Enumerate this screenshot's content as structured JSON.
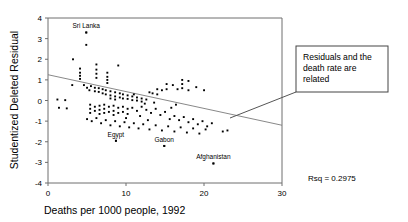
{
  "chart_data": {
    "type": "scatter",
    "title": "",
    "xlabel": "Deaths per 1000 people, 1992",
    "ylabel": "Studentized Deleted Residual",
    "xlim": [
      0,
      30
    ],
    "ylim": [
      -4,
      4
    ],
    "xticks": [
      0,
      10,
      20,
      30
    ],
    "yticks": [
      4,
      3,
      2,
      1,
      0,
      -1,
      -2,
      -3,
      -4
    ],
    "grid": false,
    "legend": "none",
    "fit_line": {
      "type": "linear-regression",
      "x_start": 0,
      "y_start": 1.25,
      "x_end": 30,
      "y_end": -1.2
    },
    "annotations": [
      {
        "name": "rsq",
        "text": "Rsq = 0.2975",
        "x_px": 308,
        "y_px": 181
      }
    ],
    "callout": {
      "lines": [
        "Residuals and the",
        "death rate are",
        "related"
      ],
      "box_x_px": 296,
      "box_y_px": 46,
      "box_w_px": 92,
      "box_h_px": 46,
      "leader_from_px": [
        296,
        92
      ],
      "leader_to_px": [
        230,
        118
      ]
    },
    "point_labels": [
      {
        "name": "sri-lanka",
        "text": "Sri Lanka",
        "x": 4.9,
        "y": 3.3
      },
      {
        "name": "egypt",
        "text": "Egypt",
        "x": 8.7,
        "y": -1.95
      },
      {
        "name": "gabon",
        "text": "Gabon",
        "x": 14.9,
        "y": -2.2
      },
      {
        "name": "afghanistan",
        "text": "Afghanistan",
        "x": 21.2,
        "y": -3.05
      }
    ],
    "points": [
      [
        4.9,
        3.3
      ],
      [
        4.9,
        2.7
      ],
      [
        3.2,
        2.0
      ],
      [
        6.2,
        1.75
      ],
      [
        4.1,
        1.55
      ],
      [
        4.1,
        1.35
      ],
      [
        4.1,
        1.2
      ],
      [
        4.1,
        1.05
      ],
      [
        6.2,
        1.5
      ],
      [
        6.2,
        1.3
      ],
      [
        6.2,
        1.1
      ],
      [
        7.6,
        1.35
      ],
      [
        7.6,
        1.15
      ],
      [
        7.6,
        1.0
      ],
      [
        7.6,
        0.85
      ],
      [
        9.0,
        1.7
      ],
      [
        3.1,
        0.75
      ],
      [
        4.6,
        0.75
      ],
      [
        5.0,
        0.62
      ],
      [
        5.5,
        0.7
      ],
      [
        5.3,
        0.5
      ],
      [
        6.0,
        0.62
      ],
      [
        6.0,
        0.45
      ],
      [
        6.5,
        0.6
      ],
      [
        6.5,
        0.42
      ],
      [
        7.0,
        0.55
      ],
      [
        7.0,
        0.35
      ],
      [
        7.4,
        0.5
      ],
      [
        7.4,
        0.3
      ],
      [
        8.0,
        0.45
      ],
      [
        8.0,
        0.25
      ],
      [
        8.0,
        0.1
      ],
      [
        8.6,
        0.4
      ],
      [
        8.6,
        0.2
      ],
      [
        8.6,
        0.05
      ],
      [
        9.2,
        0.35
      ],
      [
        9.2,
        0.15
      ],
      [
        9.6,
        0.3
      ],
      [
        9.6,
        0.1
      ],
      [
        10.2,
        0.25
      ],
      [
        10.2,
        0.08
      ],
      [
        10.8,
        0.2
      ],
      [
        10.8,
        0.02
      ],
      [
        11.4,
        0.15
      ],
      [
        11.4,
        0.0
      ],
      [
        12.0,
        0.1
      ],
      [
        12.0,
        -0.05
      ],
      [
        12.6,
        0.05
      ],
      [
        13.0,
        0.4
      ],
      [
        13.4,
        0.35
      ],
      [
        14.0,
        0.55
      ],
      [
        14.0,
        0.3
      ],
      [
        14.6,
        0.5
      ],
      [
        15.2,
        0.8
      ],
      [
        15.2,
        0.55
      ],
      [
        16.0,
        0.75
      ],
      [
        16.6,
        0.55
      ],
      [
        17.2,
        1.0
      ],
      [
        17.2,
        0.8
      ],
      [
        17.2,
        0.6
      ],
      [
        18.0,
        0.95
      ],
      [
        18.0,
        0.5
      ],
      [
        19.0,
        0.65
      ],
      [
        20.0,
        0.5
      ],
      [
        1.2,
        0.05
      ],
      [
        2.2,
        0.02
      ],
      [
        1.4,
        -0.35
      ],
      [
        2.4,
        -0.38
      ],
      [
        5.4,
        -0.2
      ],
      [
        5.4,
        -0.4
      ],
      [
        5.4,
        -0.6
      ],
      [
        6.0,
        -0.3
      ],
      [
        6.0,
        -0.5
      ],
      [
        6.6,
        -0.25
      ],
      [
        6.6,
        -0.45
      ],
      [
        6.6,
        -0.65
      ],
      [
        7.2,
        -0.2
      ],
      [
        7.2,
        -0.4
      ],
      [
        7.2,
        -0.6
      ],
      [
        7.8,
        -0.3
      ],
      [
        7.8,
        -0.55
      ],
      [
        8.4,
        -0.25
      ],
      [
        8.4,
        -0.5
      ],
      [
        8.4,
        -0.7
      ],
      [
        9.0,
        -0.35
      ],
      [
        9.0,
        -0.6
      ],
      [
        9.6,
        -0.3
      ],
      [
        9.6,
        -0.55
      ],
      [
        10.2,
        -0.4
      ],
      [
        10.2,
        -0.65
      ],
      [
        10.8,
        -0.35
      ],
      [
        11.4,
        -0.5
      ],
      [
        12.0,
        -0.3
      ],
      [
        12.6,
        -0.45
      ],
      [
        13.2,
        -0.6
      ],
      [
        13.8,
        -0.4
      ],
      [
        14.4,
        -0.7
      ],
      [
        15.0,
        -0.55
      ],
      [
        15.6,
        -0.9
      ],
      [
        16.2,
        -0.75
      ],
      [
        16.8,
        -0.95
      ],
      [
        17.4,
        -0.8
      ],
      [
        18.0,
        -1.05
      ],
      [
        18.6,
        -0.9
      ],
      [
        19.2,
        -1.15
      ],
      [
        19.8,
        -1.0
      ],
      [
        20.4,
        -1.25
      ],
      [
        21.0,
        -1.1
      ],
      [
        5.0,
        -0.9
      ],
      [
        5.6,
        -1.0
      ],
      [
        6.2,
        -0.85
      ],
      [
        6.8,
        -1.1
      ],
      [
        7.4,
        -0.95
      ],
      [
        8.0,
        -1.2
      ],
      [
        8.6,
        -1.0
      ],
      [
        9.2,
        -1.25
      ],
      [
        9.8,
        -1.05
      ],
      [
        10.4,
        -1.3
      ],
      [
        11.0,
        -1.1
      ],
      [
        11.6,
        -1.35
      ],
      [
        12.2,
        -1.15
      ],
      [
        13.0,
        -1.4
      ],
      [
        13.8,
        -1.2
      ],
      [
        14.6,
        -1.45
      ],
      [
        15.4,
        -1.25
      ],
      [
        16.2,
        -1.5
      ],
      [
        17.0,
        -1.3
      ],
      [
        17.8,
        -1.55
      ],
      [
        18.6,
        -1.35
      ],
      [
        19.4,
        -1.6
      ],
      [
        20.2,
        -1.4
      ],
      [
        8.7,
        -1.95
      ],
      [
        14.9,
        -2.2
      ],
      [
        21.2,
        -3.05
      ],
      [
        22.4,
        -1.5
      ],
      [
        23.0,
        -1.45
      ],
      [
        12.4,
        -0.15
      ],
      [
        13.6,
        -0.1
      ],
      [
        11.0,
        0.3
      ],
      [
        10.0,
        -0.85
      ],
      [
        11.8,
        -0.75
      ],
      [
        12.8,
        -0.95
      ],
      [
        15.8,
        -0.35
      ],
      [
        16.4,
        -0.2
      ]
    ]
  }
}
